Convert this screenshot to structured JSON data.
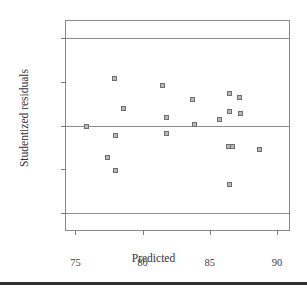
{
  "chart_data": {
    "type": "scatter",
    "title": "",
    "xlabel": "Predicted",
    "ylabel": "Studentized residuals",
    "xlim": [
      74.3,
      90.9
    ],
    "ylim": [
      -3.6,
      3.6
    ],
    "xticks": [
      "75",
      "80",
      "85",
      "90"
    ],
    "xtick_values": [
      75,
      80,
      85,
      90
    ],
    "yticks": [
      "3.00",
      "1.50",
      "0.00",
      "-1.50",
      "-3.00"
    ],
    "ytick_values": [
      3.0,
      1.5,
      0.0,
      -1.5,
      -3.0
    ],
    "grid": false,
    "legend": null,
    "reference_lines": [
      3.0,
      0.0,
      -3.0
    ],
    "points": [
      {
        "x": 75.8,
        "y": -0.02
      },
      {
        "x": 77.4,
        "y": -1.11
      },
      {
        "x": 77.9,
        "y": 1.62
      },
      {
        "x": 78.0,
        "y": -0.36
      },
      {
        "x": 78.0,
        "y": -1.54
      },
      {
        "x": 78.6,
        "y": 0.6
      },
      {
        "x": 81.5,
        "y": 1.38
      },
      {
        "x": 81.8,
        "y": 0.26
      },
      {
        "x": 81.8,
        "y": -0.28
      },
      {
        "x": 83.7,
        "y": 0.88
      },
      {
        "x": 83.9,
        "y": 0.03
      },
      {
        "x": 85.7,
        "y": 0.21
      },
      {
        "x": 86.5,
        "y": 1.11
      },
      {
        "x": 86.5,
        "y": 0.48
      },
      {
        "x": 86.4,
        "y": -0.74
      },
      {
        "x": 86.7,
        "y": -0.72
      },
      {
        "x": 86.5,
        "y": -2.04
      },
      {
        "x": 87.2,
        "y": 0.98
      },
      {
        "x": 87.3,
        "y": 0.42
      },
      {
        "x": 88.7,
        "y": -0.82
      }
    ]
  },
  "colors": {
    "marker_fill": "#b9b9b9",
    "marker_edge": "#6e6e6e",
    "axis": "#8a8a8a",
    "text": "#3a3a3a",
    "background": "#ffffff",
    "bottom_rule": "#2f2f2f"
  }
}
